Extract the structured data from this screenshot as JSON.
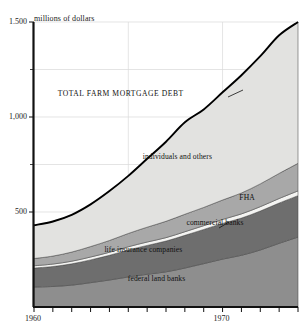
{
  "chart_data": {
    "type": "area",
    "title": "",
    "annotations": [
      {
        "id": "total-curve",
        "text": "TOTAL FARM MORTGAGE DEBT",
        "x": 1964.6,
        "y": 1120,
        "leader": true
      },
      {
        "id": "individuals",
        "text": "individuals and others",
        "x": 1967.6,
        "y": 790
      },
      {
        "id": "fha",
        "text": "FHA",
        "x": 1971.3,
        "y": 575
      },
      {
        "id": "commercial",
        "text": "commercial banks",
        "x": 1969.6,
        "y": 440,
        "leader": true
      },
      {
        "id": "life-insurance",
        "text": "life insurance companies",
        "x": 1965.8,
        "y": 300
      },
      {
        "id": "federal-land",
        "text": "federal land banks",
        "x": 1966.5,
        "y": 145
      }
    ],
    "xlabel": "",
    "ylabel": "millions of dollars",
    "yunit_label": "millions of dollars",
    "xlim": [
      1960,
      1974
    ],
    "ylim": [
      0,
      1500
    ],
    "grid": true,
    "grid_x_values": [
      1965,
      1970
    ],
    "legend_position": "inline-band-labels",
    "y_ticks_major": [
      500,
      1000,
      1500
    ],
    "y_tick_labels_major": [
      "500",
      "1,000",
      "1.500"
    ],
    "y_ticks_minor": [
      750,
      1250
    ],
    "x_ticks": [
      1960,
      1961,
      1962,
      1963,
      1964,
      1965,
      1966,
      1967,
      1968,
      1969,
      1970,
      1971,
      1972,
      1973,
      1974
    ],
    "x_tick_labels": [
      {
        "value": 1960,
        "label": "1960"
      },
      {
        "value": 1970,
        "label": "1970"
      }
    ],
    "x": [
      1960,
      1961,
      1962,
      1963,
      1964,
      1965,
      1966,
      1967,
      1968,
      1969,
      1970,
      1971,
      1972,
      1973,
      1974
    ],
    "stack_order_bottom_to_top": [
      "federal land banks",
      "life insurance companies",
      "commercial banks",
      "FHA",
      "individuals and others"
    ],
    "series": [
      {
        "name": "federal land banks",
        "color": "#8e8e8e",
        "values": [
          105,
          108,
          115,
          128,
          142,
          158,
          172,
          185,
          205,
          228,
          252,
          272,
          300,
          335,
          368
        ]
      },
      {
        "name": "life insurance companies",
        "color": "#6e6e6e",
        "values": [
          100,
          105,
          112,
          120,
          130,
          142,
          152,
          162,
          172,
          180,
          188,
          196,
          205,
          212,
          218
        ]
      },
      {
        "name": "commercial banks",
        "color": "#f4f4f2",
        "values": [
          12,
          13,
          14,
          15,
          16,
          17,
          18,
          18,
          19,
          20,
          21,
          22,
          23,
          24,
          25
        ]
      },
      {
        "name": "FHA",
        "color": "#a8a8a8",
        "values": [
          38,
          42,
          48,
          55,
          62,
          70,
          78,
          86,
          92,
          96,
          102,
          110,
          120,
          132,
          145
        ]
      },
      {
        "name": "individuals and others",
        "color": "#e2e2e0",
        "values": [
          175,
          182,
          196,
          222,
          260,
          303,
          360,
          419,
          484,
          516,
          567,
          620,
          672,
          727,
          744
        ]
      }
    ],
    "totals": [
      430,
      450,
      485,
      540,
      610,
      690,
      780,
      870,
      972,
      1040,
      1130,
      1220,
      1320,
      1430,
      1500
    ],
    "total_series_name": "TOTAL FARM MORTGAGE DEBT"
  },
  "colors": {
    "axis": "#111111",
    "grid": "#d8d8d8",
    "total_line": "#000000",
    "background": "#ffffff"
  }
}
